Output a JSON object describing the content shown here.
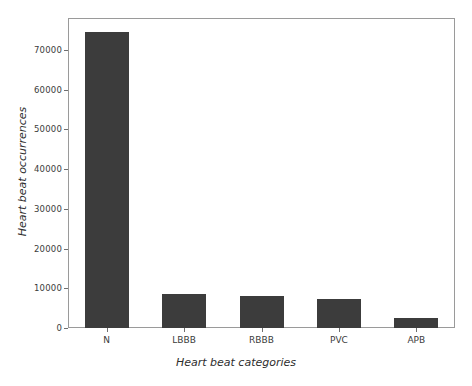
{
  "chart_data": {
    "type": "bar",
    "title": "",
    "xlabel": "Heart beat categories",
    "ylabel": "Heart beat occurrences",
    "categories": [
      "N",
      "LBBB",
      "RBBB",
      "PVC",
      "APB"
    ],
    "values": [
      74500,
      8600,
      8100,
      7200,
      2600
    ],
    "series": [
      {
        "name": "Heart beat occurrences",
        "values": [
          74500,
          8600,
          8100,
          7200,
          2600
        ]
      }
    ],
    "ylim": [
      0,
      78000
    ],
    "yticks": [
      0,
      10000,
      20000,
      30000,
      40000,
      50000,
      60000,
      70000
    ],
    "ytick_labels": [
      "0",
      "10000",
      "20000",
      "30000",
      "40000",
      "50000",
      "60000",
      "70000"
    ],
    "grid": false,
    "legend": null,
    "bar_color": "#3c3c3c",
    "frame_color": "#9a9a9a",
    "background_color": "#ffffff"
  }
}
